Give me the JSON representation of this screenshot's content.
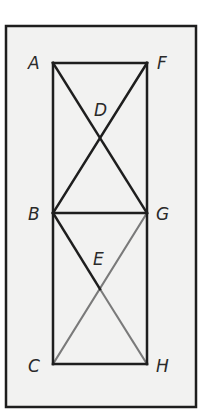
{
  "diagram": {
    "colors": {
      "background": "#f2f2f1",
      "frame": "#1e1e1e",
      "primary_line": "#1e1e1e",
      "secondary_line": "#7a7a7a",
      "label": "#2a2a2a"
    },
    "points": {
      "A": {
        "label": "A",
        "x": 53,
        "y": 63,
        "label_x": 28,
        "label_y": 69
      },
      "F": {
        "label": "F",
        "x": 147,
        "y": 63,
        "label_x": 157,
        "label_y": 69
      },
      "D": {
        "label": "D",
        "x": 100,
        "y": 138,
        "label_x": 94,
        "label_y": 116
      },
      "B": {
        "label": "B",
        "x": 53,
        "y": 213,
        "label_x": 28,
        "label_y": 220
      },
      "G": {
        "label": "G",
        "x": 147,
        "y": 213,
        "label_x": 156,
        "label_y": 220
      },
      "E": {
        "label": "E",
        "x": 100,
        "y": 289,
        "label_x": 93,
        "label_y": 265
      },
      "C": {
        "label": "C",
        "x": 53,
        "y": 364,
        "label_x": 28,
        "label_y": 372
      },
      "H": {
        "label": "H",
        "x": 147,
        "y": 364,
        "label_x": 156,
        "label_y": 372
      }
    },
    "segments": [
      {
        "from": "A",
        "to": "F",
        "style": "primary"
      },
      {
        "from": "A",
        "to": "C",
        "style": "primary"
      },
      {
        "from": "F",
        "to": "H",
        "style": "primary"
      },
      {
        "from": "C",
        "to": "H",
        "style": "primary"
      },
      {
        "from": "A",
        "to": "G",
        "style": "primary"
      },
      {
        "from": "F",
        "to": "B",
        "style": "primary"
      },
      {
        "from": "B",
        "to": "G",
        "style": "primary"
      },
      {
        "from": "B",
        "to": "E",
        "style": "primary"
      },
      {
        "from": "E",
        "to": "H",
        "style": "secondary"
      },
      {
        "from": "G",
        "to": "C",
        "style": "secondary"
      }
    ]
  }
}
